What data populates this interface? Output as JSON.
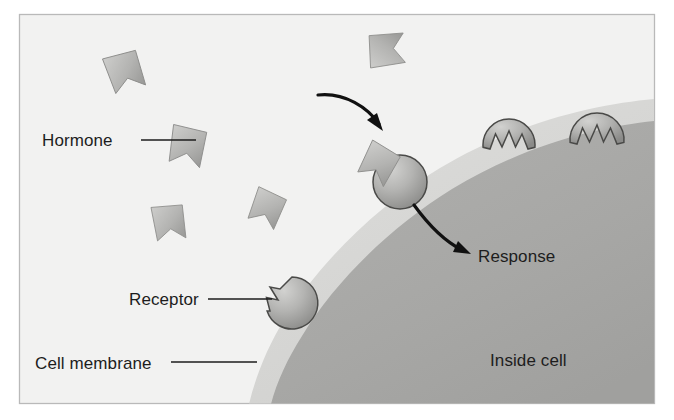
{
  "figure": {
    "frame": {
      "border_color": "#b9b9b9",
      "background_color": "#f2f2f1"
    },
    "colors": {
      "extracellular_background": "#f2f2f1",
      "membrane_band": "#d8d8d6",
      "cell_interior": "#a8a8a6",
      "hormone_fill_light": "#c2c2c0",
      "hormone_fill_dark": "#9d9d9b",
      "hormone_outline": "#8e8e8c",
      "receptor_fill_light": "#c6c6c4",
      "receptor_fill_dark": "#8f8f8d",
      "receptor_outline": "#4a4a48",
      "label_text": "#1d1d1d",
      "arrow_color": "#111111"
    }
  },
  "labels": [
    {
      "id": "hormone",
      "text": "Hormone",
      "x": 42,
      "y": 146
    },
    {
      "id": "receptor",
      "text": "Receptor",
      "x": 129,
      "y": 305
    },
    {
      "id": "cell-membrane",
      "text": "Cell membrane",
      "x": 35,
      "y": 369
    },
    {
      "id": "response",
      "text": "Response",
      "x": 478,
      "y": 262
    },
    {
      "id": "inside-cell",
      "text": "Inside cell",
      "x": 490,
      "y": 366
    }
  ],
  "leader_lines": [
    {
      "id": "hormone-leader",
      "x1": 141,
      "y1": 140,
      "x2": 196,
      "y2": 140
    },
    {
      "id": "receptor-leader",
      "x1": 208,
      "y1": 299,
      "x2": 272,
      "y2": 299
    },
    {
      "id": "cell-membrane-leader",
      "x1": 171,
      "y1": 362,
      "x2": 257,
      "y2": 362
    }
  ],
  "flow_arrows": [
    {
      "id": "binding-arrow",
      "meaning": "hormone binds to receptor",
      "path": "M 318 95 C 345 92 368 108 381 126",
      "head": "M 381 126 L 369 118 L 378 113 Z"
    },
    {
      "id": "response-arrow",
      "meaning": "receptor triggers response inside cell",
      "path": "M 414 205 C 429 226 448 242 466 251",
      "head": "M 470 253 L 454 251 L 459 242 Z"
    }
  ],
  "hormones": [
    {
      "id": "hormone-1",
      "x": 119,
      "y": 79,
      "rotation": -18,
      "scale": 1.0,
      "state": "free"
    },
    {
      "id": "hormone-2",
      "x": 191,
      "y": 143,
      "rotation": 10,
      "scale": 1.0,
      "state": "free"
    },
    {
      "id": "hormone-3",
      "x": 166,
      "y": 225,
      "rotation": -8,
      "scale": 0.92,
      "state": "free"
    },
    {
      "id": "hormone-4",
      "x": 275,
      "y": 202,
      "rotation": 22,
      "scale": 0.9,
      "state": "free"
    },
    {
      "id": "hormone-5",
      "x": 369,
      "y": 71,
      "rotation": -96,
      "scale": 0.95,
      "state": "free"
    },
    {
      "id": "hormone-6",
      "x": 389,
      "y": 157,
      "rotation": 28,
      "scale": 0.95,
      "state": "bound"
    }
  ],
  "receptors": [
    {
      "id": "receptor-bound-center",
      "cx": 400,
      "cy": 182,
      "r": 27,
      "state": "bound",
      "notch_angle": 218
    },
    {
      "id": "receptor-free-left",
      "cx": 292,
      "cy": 303,
      "r": 26,
      "state": "unbound",
      "notch_angle": 186
    },
    {
      "id": "receptor-free-mid",
      "cx": 509,
      "cy": 145,
      "r": 26,
      "state": "unbound",
      "notch_angle": 272
    },
    {
      "id": "receptor-free-right",
      "cx": 597,
      "cy": 140,
      "r": 27,
      "state": "unbound",
      "notch_angle": 276
    }
  ],
  "geometry": {
    "frame": {
      "x": 19,
      "y": 14,
      "width": 636,
      "height": 390
    },
    "membrane_outer_note": "light band edge of cell surface",
    "cell_interior_note": "dark gray curved cell body filling lower-right"
  }
}
